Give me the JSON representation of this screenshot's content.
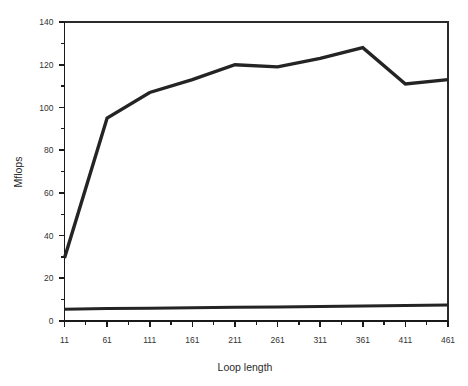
{
  "chart_data": {
    "type": "line",
    "title": "",
    "subtitle": "",
    "xlabel": "Loop length",
    "ylabel": "Mflops",
    "x": [
      11,
      61,
      111,
      161,
      211,
      261,
      311,
      361,
      411,
      461
    ],
    "xtick_labels": [
      "11",
      "61",
      "111",
      "161",
      "211",
      "261",
      "311",
      "361",
      "411",
      "461"
    ],
    "ytick_labels": [
      "0",
      "20",
      "40",
      "60",
      "80",
      "100",
      "120",
      "140"
    ],
    "ytick_values": [
      0,
      20,
      40,
      60,
      80,
      100,
      120,
      140
    ],
    "yminor_values": [
      10,
      30,
      50,
      70,
      90,
      110,
      130
    ],
    "xminor_values": [
      36,
      86,
      136,
      186,
      236,
      286,
      336,
      386,
      436
    ],
    "xlim": [
      11,
      461
    ],
    "ylim": [
      0,
      140
    ],
    "grid": false,
    "legend": "none",
    "series": [
      {
        "name": "upper",
        "color": "#242424",
        "values": [
          29.5,
          95,
          107,
          113,
          120,
          119,
          123,
          128,
          111,
          113
        ]
      },
      {
        "name": "lower",
        "color": "#242424",
        "values": [
          5.5,
          5.8,
          6.0,
          6.2,
          6.4,
          6.6,
          6.8,
          7.0,
          7.2,
          7.5
        ]
      }
    ]
  },
  "colors": {
    "background": "#ffffff",
    "axis": "#1a1a1a",
    "series": "#242424"
  }
}
